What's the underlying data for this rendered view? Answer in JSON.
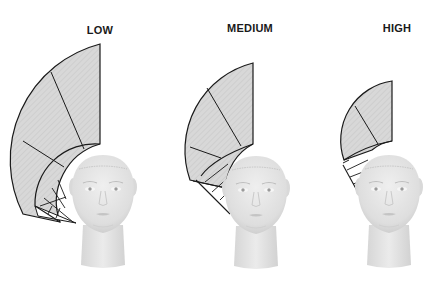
{
  "diagram": {
    "panels": [
      {
        "label": "LOW",
        "label_x": 100,
        "label_y": 24
      },
      {
        "label": "MEDIUM",
        "label_x": 250,
        "label_y": 22
      },
      {
        "label": "HIGH",
        "label_x": 397,
        "label_y": 22
      }
    ],
    "colors": {
      "wedge_fill": "#d6d6d6",
      "wedge_stroke": "#1a1a1a",
      "head": "#e6e6e6",
      "head_shade": "#cfcfcf",
      "background": "#ffffff"
    }
  }
}
